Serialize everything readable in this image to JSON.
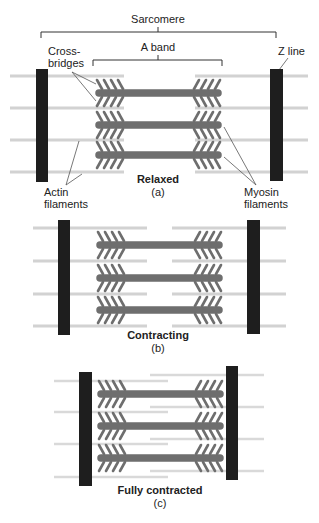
{
  "figure": {
    "labels": {
      "sarcomere": "Sarcomere",
      "a_band": "A band",
      "z_line": "Z line",
      "cross_bridges_1": "Cross-",
      "cross_bridges_2": "bridges",
      "actin_1": "Actin",
      "actin_2": "filaments",
      "myosin_1": "Myosin",
      "myosin_2": "filaments"
    },
    "panels": [
      {
        "id": "a",
        "title": "Relaxed",
        "letter": "(a)"
      },
      {
        "id": "b",
        "title": "Contracting",
        "letter": "(b)"
      },
      {
        "id": "c",
        "title": "Fully contracted",
        "letter": "(c)"
      }
    ],
    "colors": {
      "z_line": "#1e1e1e",
      "myosin": "#6e6e6e",
      "actin": "#d2d2d2",
      "leader": "#555555",
      "text": "#222222"
    }
  }
}
